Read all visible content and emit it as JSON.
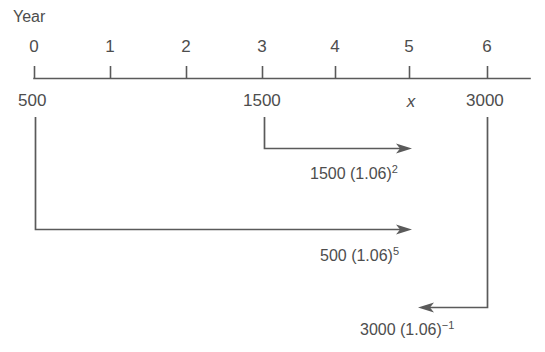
{
  "diagram": {
    "axis_title": "Year",
    "stroke_color": "#5a5a5a",
    "text_color": "#4d4d4d",
    "background": "#ffffff",
    "axis": {
      "tick_labels": [
        "0",
        "1",
        "2",
        "3",
        "4",
        "5",
        "6"
      ],
      "tick_x": [
        34,
        110,
        186,
        262,
        335,
        409,
        487
      ],
      "line_y": 78,
      "line_x_start": 34,
      "line_x_end": 530
    },
    "cash_flows": [
      {
        "name": "deposit-500",
        "label": "500",
        "year": 0,
        "x": 34
      },
      {
        "name": "deposit-1500",
        "label": "1500",
        "year": 3,
        "x": 262
      },
      {
        "name": "unknown-x",
        "label": "x",
        "year": 5,
        "x": 409
      },
      {
        "name": "deposit-3000",
        "label": "3000",
        "year": 6,
        "x": 487
      }
    ],
    "arrows": [
      {
        "name": "arrow-1500",
        "direction": "right",
        "from_x": 264,
        "from_y": 117,
        "corner_y": 148,
        "to_x": 412,
        "expression_base": "1500 (1.06)",
        "expression_exponent": "2",
        "expr_x": 310,
        "expr_y": 166
      },
      {
        "name": "arrow-500",
        "direction": "right",
        "from_x": 35,
        "from_y": 117,
        "corner_y": 230,
        "to_x": 412,
        "expression_base": "500 (1.06)",
        "expression_exponent": "5",
        "expr_x": 320,
        "expr_y": 248
      },
      {
        "name": "arrow-3000",
        "direction": "left",
        "from_x": 487,
        "from_y": 117,
        "corner_y": 307,
        "to_x": 418,
        "expression_base": "3000 (1.06)",
        "expression_exponent": "−1",
        "expr_x": 360,
        "expr_y": 322
      }
    ]
  }
}
